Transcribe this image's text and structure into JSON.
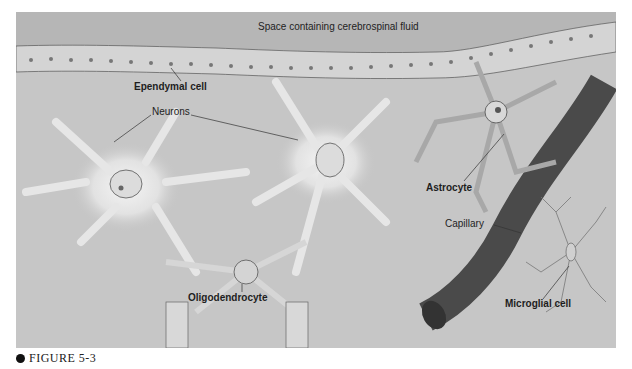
{
  "figure": {
    "caption": "FIGURE 5-3",
    "labels": {
      "csf_space": "Space containing cerebrospinal fluid",
      "ependymal": "Ependymal cell",
      "neurons": "Neurons",
      "astrocyte": "Astrocyte",
      "capillary": "Capillary",
      "oligodendrocyte": "Oligodendrocyte",
      "microglial": "Microglial cell"
    },
    "colors": {
      "background": "#c6c6c6",
      "fluid": "#b4b4b4",
      "capillary": "#585858",
      "neuron_glow": "#ececec",
      "outline": "#3a3a3a"
    }
  }
}
